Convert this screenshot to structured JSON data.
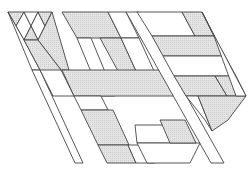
{
  "diagram": {
    "width": 251,
    "height": 174,
    "stroke": "#444444",
    "fill_shaded": "#dcdcdc",
    "fill_blank": "#ffffff",
    "shear": 0.56,
    "origin_y": 12,
    "cells": [
      {
        "id": "L-tri-1",
        "shaded": true,
        "pts": [
          [
            8,
            12
          ],
          [
            24,
            12
          ],
          [
            16,
            26
          ]
        ]
      },
      {
        "id": "L-tri-2",
        "shaded": false,
        "pts": [
          [
            24,
            12
          ],
          [
            16,
            26
          ],
          [
            24,
            40
          ],
          [
            31,
            26
          ]
        ]
      },
      {
        "id": "L-tri-3",
        "shaded": false,
        "pts": [
          [
            24,
            12
          ],
          [
            38,
            12
          ],
          [
            31,
            26
          ]
        ]
      },
      {
        "id": "L-tri-4",
        "shaded": false,
        "pts": [
          [
            38,
            12
          ],
          [
            31,
            26
          ],
          [
            38,
            40
          ],
          [
            45,
            26
          ]
        ]
      },
      {
        "id": "L-tri-5",
        "shaded": true,
        "pts": [
          [
            38,
            12
          ],
          [
            52,
            12
          ],
          [
            45,
            26
          ]
        ]
      },
      {
        "id": "L-band-a",
        "shaded": false,
        "pts": [
          [
            8,
            12
          ],
          [
            16,
            26
          ],
          [
            24,
            40
          ],
          [
            40,
            70
          ],
          [
            32,
            70
          ]
        ]
      },
      {
        "id": "L-band-b",
        "shaded": true,
        "pts": [
          [
            31,
            26
          ],
          [
            38,
            40
          ],
          [
            24,
            40
          ]
        ]
      },
      {
        "id": "L-band-c",
        "shaded": true,
        "pts": [
          [
            45,
            26
          ],
          [
            52,
            12
          ],
          [
            69,
            70
          ],
          [
            61,
            70
          ],
          [
            38,
            40
          ]
        ]
      },
      {
        "id": "L-mid-1",
        "shaded": true,
        "pts": [
          [
            24,
            40
          ],
          [
            38,
            40
          ],
          [
            61,
            70
          ],
          [
            53,
            96
          ],
          [
            40,
            70
          ]
        ]
      },
      {
        "id": "L-lower-1",
        "shaded": false,
        "pts": [
          [
            32,
            70
          ],
          [
            40,
            70
          ],
          [
            83,
            163
          ],
          [
            75,
            163
          ]
        ]
      },
      {
        "id": "L-lower-2",
        "shaded": false,
        "pts": [
          [
            40,
            70
          ],
          [
            61,
            70
          ],
          [
            74,
            96
          ],
          [
            53,
            96
          ]
        ]
      },
      {
        "id": "M-top",
        "shaded": true,
        "pts": [
          [
            62,
            12
          ],
          [
            108,
            12
          ],
          [
            121,
            38
          ],
          [
            77,
            38
          ]
        ]
      },
      {
        "id": "M-right-top",
        "shaded": false,
        "pts": [
          [
            108,
            12
          ],
          [
            126,
            12
          ],
          [
            139,
            38
          ],
          [
            121,
            38
          ]
        ]
      },
      {
        "id": "M-left-band",
        "shaded": false,
        "pts": [
          [
            77,
            38
          ],
          [
            91,
            38
          ],
          [
            115,
            96
          ],
          [
            101,
            96
          ]
        ]
      },
      {
        "id": "M-diag-shaded",
        "shaded": true,
        "pts": [
          [
            100,
            38
          ],
          [
            121,
            38
          ],
          [
            141,
            82
          ],
          [
            124,
            82
          ]
        ]
      },
      {
        "id": "M-inner-white",
        "shaded": false,
        "pts": [
          [
            121,
            38
          ],
          [
            139,
            38
          ],
          [
            159,
            82
          ],
          [
            141,
            82
          ]
        ]
      },
      {
        "id": "M-cross-band",
        "shaded": true,
        "pts": [
          [
            62,
            70
          ],
          [
            163,
            70
          ],
          [
            174,
            96
          ],
          [
            74,
            96
          ]
        ]
      },
      {
        "id": "M-lower-left",
        "shaded": false,
        "pts": [
          [
            74,
            96
          ],
          [
            101,
            96
          ],
          [
            108,
            110
          ],
          [
            81,
            110
          ]
        ]
      },
      {
        "id": "M-lower-shaded",
        "shaded": true,
        "pts": [
          [
            81,
            110
          ],
          [
            113,
            110
          ],
          [
            129,
            145
          ],
          [
            98,
            145
          ]
        ]
      },
      {
        "id": "M-bottom-shaded",
        "shaded": true,
        "pts": [
          [
            98,
            145
          ],
          [
            128,
            145
          ],
          [
            136,
            163
          ],
          [
            107,
            163
          ]
        ]
      },
      {
        "id": "M-bottom-white",
        "shaded": false,
        "pts": [
          [
            128,
            145
          ],
          [
            147,
            145
          ],
          [
            155,
            163
          ],
          [
            136,
            163
          ]
        ]
      },
      {
        "id": "M-right-band",
        "shaded": false,
        "pts": [
          [
            126,
            12
          ],
          [
            139,
            12
          ],
          [
            224,
            163
          ],
          [
            211,
            163
          ]
        ]
      },
      {
        "id": "R-top-white",
        "shaded": false,
        "pts": [
          [
            137,
            12
          ],
          [
            182,
            12
          ],
          [
            195,
            36
          ],
          [
            152,
            36
          ]
        ]
      },
      {
        "id": "R-top-shaded",
        "shaded": true,
        "pts": [
          [
            182,
            12
          ],
          [
            202,
            12
          ],
          [
            214,
            36
          ],
          [
            195,
            36
          ]
        ]
      },
      {
        "id": "R-row2-shaded",
        "shaded": true,
        "pts": [
          [
            152,
            36
          ],
          [
            214,
            36
          ],
          [
            225,
            56
          ],
          [
            163,
            56
          ]
        ]
      },
      {
        "id": "R-row3-white",
        "shaded": false,
        "pts": [
          [
            163,
            56
          ],
          [
            225,
            56
          ],
          [
            236,
            76
          ],
          [
            174,
            76
          ]
        ]
      },
      {
        "id": "R-row4-shaded",
        "shaded": true,
        "pts": [
          [
            174,
            76
          ],
          [
            215,
            76
          ],
          [
            227,
            96
          ],
          [
            186,
            96
          ]
        ]
      },
      {
        "id": "R-row4-right",
        "shaded": true,
        "pts": [
          [
            215,
            76
          ],
          [
            236,
            76
          ],
          [
            246,
            96
          ],
          [
            227,
            96
          ]
        ]
      },
      {
        "id": "R-lower-left",
        "shaded": false,
        "pts": [
          [
            186,
            96
          ],
          [
            198,
            96
          ],
          [
            212,
            131
          ],
          [
            205,
            120
          ]
        ]
      },
      {
        "id": "R-lower-shaded",
        "shaded": true,
        "pts": [
          [
            198,
            96
          ],
          [
            246,
            96
          ],
          [
            228,
            120
          ],
          [
            212,
            131
          ]
        ]
      },
      {
        "id": "R-right-edge",
        "shaded": false,
        "pts": [
          [
            202,
            12
          ],
          [
            246,
            96
          ],
          [
            236,
            96
          ],
          [
            214,
            36
          ]
        ]
      },
      {
        "id": "B-mid-row",
        "shaded": false,
        "pts": [
          [
            135,
            125
          ],
          [
            185,
            125
          ],
          [
            196,
            143
          ],
          [
            137,
            143
          ]
        ]
      },
      {
        "id": "B-bottom",
        "shaded": false,
        "pts": [
          [
            137,
            143
          ],
          [
            200,
            143
          ],
          [
            190,
            163
          ],
          [
            147,
            163
          ]
        ]
      },
      {
        "id": "B-bottom-shaded",
        "shaded": true,
        "pts": [
          [
            160,
            120
          ],
          [
            185,
            120
          ],
          [
            196,
            143
          ],
          [
            170,
            143
          ]
        ]
      }
    ]
  }
}
